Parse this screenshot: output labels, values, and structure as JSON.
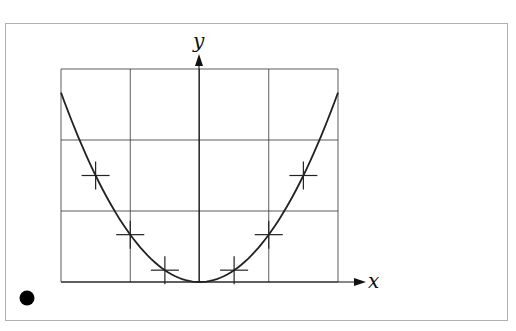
{
  "chart_data": {
    "type": "line",
    "title": "",
    "xlabel": "x",
    "ylabel": "y",
    "function": "y = x^2",
    "xlim": [
      -2,
      2
    ],
    "ylim": [
      0,
      4.5
    ],
    "grid": true,
    "grid_columns": 4,
    "grid_rows": 3,
    "legend": "none",
    "series": [
      {
        "name": "curve",
        "x": [
          -2,
          -1.5,
          -1,
          -0.5,
          0,
          0.5,
          1,
          1.5,
          2
        ],
        "y": [
          4,
          2.25,
          1,
          0.25,
          0,
          0.25,
          1,
          2.25,
          4
        ]
      }
    ],
    "markers": {
      "style": "plus",
      "x": [
        -1.5,
        -1,
        -0.5,
        0.5,
        1,
        1.5
      ],
      "y": [
        2.25,
        1,
        0.25,
        0.25,
        1,
        2.25
      ]
    },
    "annotations": [
      {
        "type": "dot",
        "position": "bottom-left",
        "color": "#000000"
      }
    ]
  },
  "colors": {
    "frame": "#b0b0b0",
    "grid": "#333333",
    "curve": "#222222",
    "axis": "#111111"
  }
}
